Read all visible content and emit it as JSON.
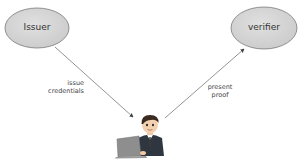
{
  "nodes": {
    "issuer": {
      "label": "Issuer"
    },
    "verifier": {
      "label": "verifier"
    },
    "holder": {
      "icon": "person-at-laptop-icon"
    }
  },
  "edges": {
    "issue": {
      "line1": "issue",
      "line2": "credentials"
    },
    "present": {
      "line1": "present",
      "line2": "proof"
    }
  },
  "colors": {
    "ellipse_fill": "#d4d4d4",
    "ellipse_stroke": "#7a7a7a",
    "arrow": "#555555"
  }
}
